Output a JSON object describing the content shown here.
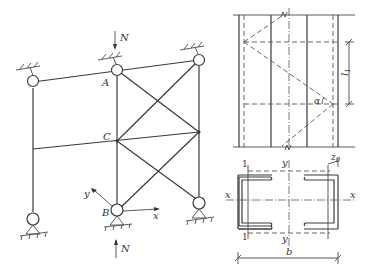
{
  "figure": {
    "frame_diagram": {
      "labels": {
        "joint_A": "A",
        "joint_B": "B",
        "joint_C": "C",
        "load_top": "N",
        "load_bottom": "N",
        "axis_x": "x",
        "axis_y": "y"
      }
    },
    "column_elevation": {
      "labels": {
        "spacing": "l",
        "spacing_sub": "1",
        "angle": "α"
      }
    },
    "cross_section": {
      "labels": {
        "axis_x_left": "x",
        "axis_x_right": "x",
        "axis_y_top": "y",
        "axis_y_bottom": "y",
        "axis_1_top": "1",
        "axis_1_bottom": "1",
        "offset": "z",
        "offset_sub": "0",
        "width": "b"
      }
    }
  }
}
